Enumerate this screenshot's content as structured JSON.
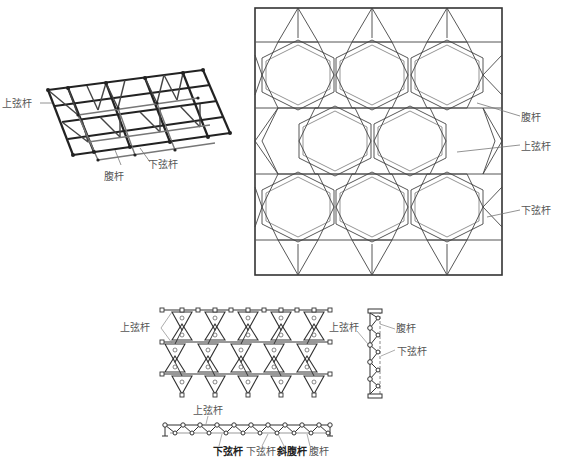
{
  "figure": {
    "perspective_view": {
      "labels": {
        "top_chord": "上弦杆",
        "web_member": "腹杆",
        "bottom_chord": "下弦杆"
      }
    },
    "plan_view": {
      "labels": {
        "web_member": "腹杆",
        "top_chord": "上弦杆",
        "bottom_chord": "下弦杆"
      }
    },
    "lower_plan": {
      "labels": {
        "top_chord_left": "上弦杆",
        "top_chord_right": "上弦杆",
        "web_member": "腹杆",
        "bottom_chord": "下弦杆"
      }
    },
    "elevation": {
      "labels": {
        "top_chord": "上弦杆",
        "bottom_chord_bold": "下弦杆",
        "bottom_chord": "下弦杆",
        "diagonal_web_bold": "斜腹杆",
        "web_member": "腹杆"
      }
    }
  },
  "colors": {
    "line": "#333333",
    "light_line": "#666666",
    "label": "#555555"
  }
}
